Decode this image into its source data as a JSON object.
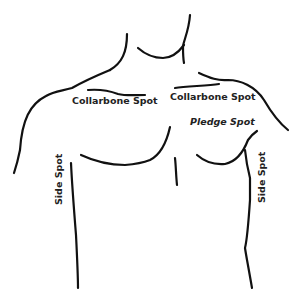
{
  "diagram": {
    "labels": {
      "collarbone_left": "Collarbone Spot",
      "collarbone_right": "Collarbone Spot",
      "pledge": "Pledge Spot",
      "side_left": "Side Spot",
      "side_right": "Side Spot"
    },
    "colors": {
      "line": "#111111",
      "text": "#222222",
      "background": "#ffffff"
    }
  }
}
